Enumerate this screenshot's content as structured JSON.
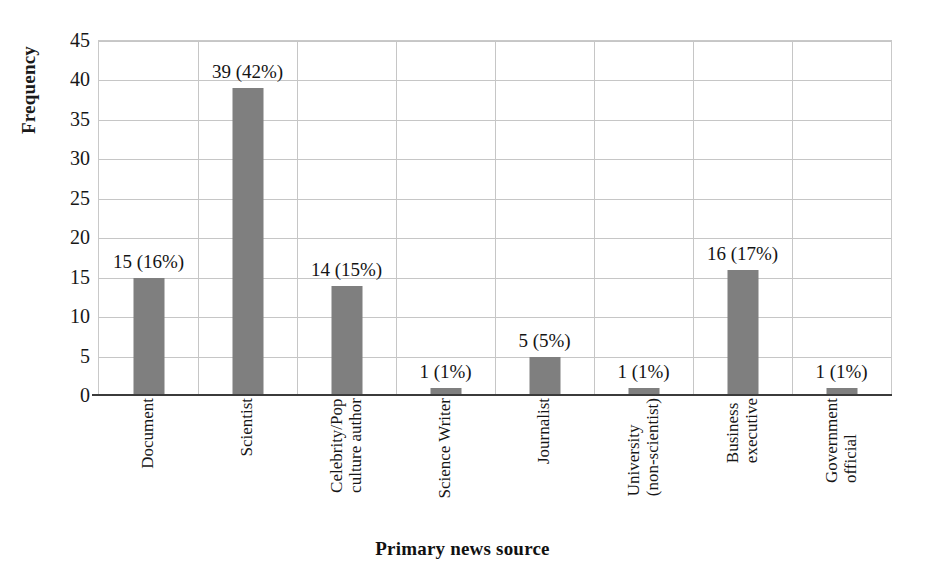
{
  "chart_data": {
    "type": "bar",
    "title": "",
    "xlabel": "Primary news source",
    "ylabel": "Frequency",
    "ylim": [
      0,
      45
    ],
    "ytick_step": 5,
    "yticks": [
      45,
      40,
      35,
      30,
      25,
      20,
      15,
      10,
      5,
      0
    ],
    "grid": true,
    "legend": null,
    "bar_color": "#7f7f7f",
    "categories": [
      "Document",
      "Scientist",
      "Celebrity/Pop culture author",
      "Science Writer",
      "Journalist",
      "University (non-scientist)",
      "Business executive",
      "Government official"
    ],
    "category_label_lines": [
      [
        "Document"
      ],
      [
        "Scientist"
      ],
      [
        "Celebrity/Pop",
        "culture author"
      ],
      [
        "Science Writer"
      ],
      [
        "Journalist"
      ],
      [
        "University",
        "(non-scientist)"
      ],
      [
        "Business",
        "executive"
      ],
      [
        "Government",
        "official"
      ]
    ],
    "values": [
      15,
      39,
      14,
      1,
      5,
      1,
      16,
      1
    ],
    "percents": [
      16,
      42,
      15,
      1,
      5,
      1,
      17,
      1
    ],
    "data_labels": [
      "15 (16%)",
      "39 (42%)",
      "14 (15%)",
      "1 (1%)",
      "5 (5%)",
      "1 (1%)",
      "16 (17%)",
      "1 (1%)"
    ]
  }
}
